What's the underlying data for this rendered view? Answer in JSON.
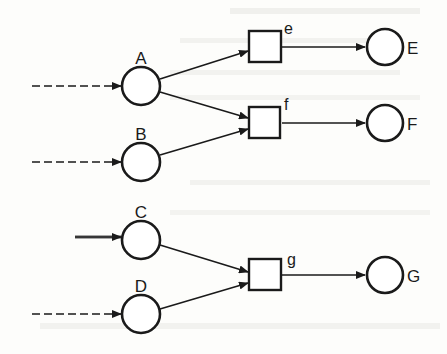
{
  "diagram": {
    "type": "petri-net",
    "places": [
      {
        "id": "A",
        "label": "A",
        "input": "dashed"
      },
      {
        "id": "B",
        "label": "B",
        "input": "dashed"
      },
      {
        "id": "C",
        "label": "C",
        "input": "dashed-highlighted"
      },
      {
        "id": "D",
        "label": "D",
        "input": "dashed"
      },
      {
        "id": "E",
        "label": "E"
      },
      {
        "id": "F",
        "label": "F"
      },
      {
        "id": "G",
        "label": "G"
      }
    ],
    "transitions": [
      {
        "id": "e",
        "label": "e"
      },
      {
        "id": "f",
        "label": "f"
      },
      {
        "id": "g",
        "label": "g"
      }
    ],
    "arcs": [
      {
        "from": "A",
        "to": "e"
      },
      {
        "from": "A",
        "to": "f"
      },
      {
        "from": "B",
        "to": "f"
      },
      {
        "from": "C",
        "to": "g"
      },
      {
        "from": "D",
        "to": "g"
      },
      {
        "from": "e",
        "to": "E"
      },
      {
        "from": "f",
        "to": "F"
      },
      {
        "from": "g",
        "to": "G"
      }
    ]
  },
  "colors": {
    "stroke": "#1a1a1a",
    "background": "#fdfdfb",
    "bleed_through_text": "#e7e7e3"
  }
}
